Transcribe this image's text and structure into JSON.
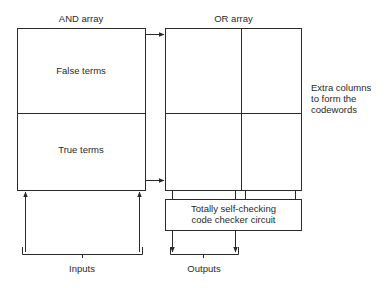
{
  "and_array": {
    "label": "AND array",
    "top_section": "False terms",
    "bottom_section": "True terms"
  },
  "or_array": {
    "label": "OR array",
    "side_note_lines": [
      "Extra columns",
      "to form the",
      "codewords"
    ]
  },
  "checker": {
    "line1": "Totally self-checking",
    "line2": "code checker circuit"
  },
  "inputs_label": "Inputs",
  "outputs_label": "Outputs",
  "colors": {
    "stroke": "#2a2a2a",
    "background": "#ffffff"
  }
}
